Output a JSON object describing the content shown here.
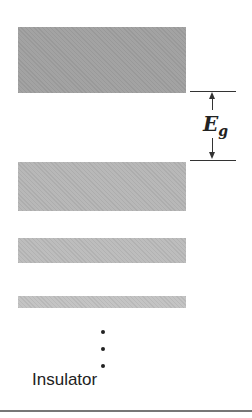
{
  "diagram": {
    "caption": "Insulator",
    "gap_label_main": "E",
    "gap_label_sub": "g",
    "bands": [
      {
        "name": "conduction-band",
        "top": 27,
        "height": 66,
        "color": "#a3a3a3"
      },
      {
        "name": "valence-band-1",
        "top": 162,
        "height": 49,
        "color": "#b8b8b8"
      },
      {
        "name": "valence-band-2",
        "top": 238,
        "height": 25,
        "color": "#bdbdbd"
      },
      {
        "name": "valence-band-3",
        "top": 296,
        "height": 12,
        "color": "#c4c4c4"
      }
    ],
    "gap": {
      "upper_line_y": 91,
      "lower_line_y": 160
    },
    "continuation_dots": [
      330,
      347,
      364
    ]
  }
}
